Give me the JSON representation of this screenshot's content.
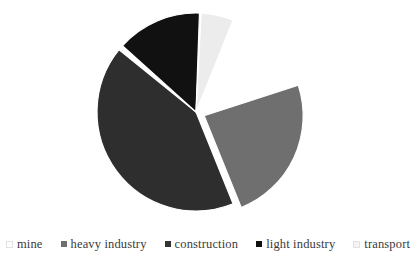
{
  "chart_data": {
    "type": "pie",
    "title": "",
    "subtitle": "",
    "xlabel": "",
    "ylabel": "",
    "grid": false,
    "legend_position": "bottom",
    "categories": [
      "mine",
      "heavy industry",
      "construction",
      "light industry",
      "transport"
    ],
    "values": [
      12,
      24,
      42,
      14,
      8
    ],
    "units": "percent",
    "colors": [
      "#ffffff",
      "#6f6f6f",
      "#2e2e2e",
      "#111111",
      "#ececec"
    ],
    "slice_outline_color": "#ffffff",
    "background": "#ffffff",
    "exploded": [
      "mine",
      "heavy industry"
    ],
    "start_angle_deg": -68,
    "direction": "clockwise",
    "slices": [
      {
        "label": "mine",
        "value": 12,
        "color": "#ffffff",
        "exploded": true,
        "start_deg": -68,
        "end_deg": -25
      },
      {
        "label": "heavy industry",
        "value": 24,
        "color": "#6f6f6f",
        "exploded": true,
        "start_deg": -18,
        "end_deg": 68
      },
      {
        "label": "construction",
        "value": 42,
        "color": "#2e2e2e",
        "exploded": false,
        "start_deg": 68,
        "end_deg": 219
      },
      {
        "label": "light industry",
        "value": 14,
        "color": "#111111",
        "exploded": false,
        "start_deg": 222,
        "end_deg": 272
      },
      {
        "label": "transport",
        "value": 8,
        "color": "#ececec",
        "exploded": false,
        "start_deg": 273,
        "end_deg": 292
      }
    ],
    "geometry": {
      "center_x": 196,
      "center_y": 112,
      "radius": 99
    }
  },
  "legend": {
    "items": [
      {
        "label": "mine",
        "swatch_color": "#ffffff",
        "pale": true
      },
      {
        "label": "heavy industry",
        "swatch_color": "#6f6f6f",
        "pale": false
      },
      {
        "label": "construction",
        "swatch_color": "#333333",
        "pale": false
      },
      {
        "label": "light industry",
        "swatch_color": "#111111",
        "pale": false
      },
      {
        "label": "transport",
        "swatch_color": "#f4f4f4",
        "pale": true
      }
    ]
  }
}
